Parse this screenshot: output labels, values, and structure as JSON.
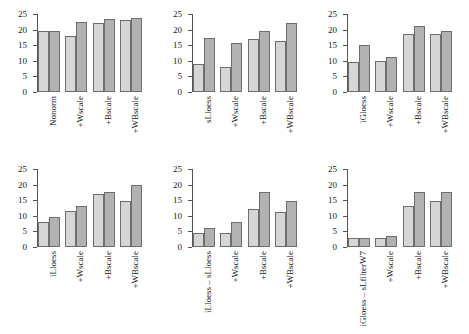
{
  "chart_data": [
    {
      "type": "bar",
      "title": "",
      "xlabel": "",
      "ylabel": "",
      "ylim": [
        0,
        25
      ],
      "yticks": [
        0,
        5,
        10,
        15,
        20,
        25
      ],
      "grid": false,
      "legend": "none",
      "categories": [
        "Nonorm",
        "+Wscale",
        "+Bscale",
        "+WBscale"
      ],
      "series": [
        {
          "name": "light",
          "values": [
            19.7,
            17.8,
            22.2,
            23.2
          ]
        },
        {
          "name": "dark",
          "values": [
            19.7,
            22.5,
            23.5,
            23.6
          ]
        }
      ]
    },
    {
      "type": "bar",
      "title": "",
      "xlabel": "",
      "ylabel": "",
      "ylim": [
        0,
        25
      ],
      "yticks": [
        0,
        5,
        10,
        15,
        20,
        25
      ],
      "grid": false,
      "legend": "none",
      "categories": [
        "sLloess",
        "+Wscale",
        "+Bscale",
        "+WBscale"
      ],
      "series": [
        {
          "name": "light",
          "values": [
            9.0,
            8.0,
            17.1,
            16.2
          ]
        },
        {
          "name": "dark",
          "values": [
            17.3,
            15.6,
            19.6,
            22.1
          ]
        }
      ]
    },
    {
      "type": "bar",
      "title": "",
      "xlabel": "",
      "ylabel": "",
      "ylim": [
        0,
        25
      ],
      "yticks": [
        0,
        5,
        10,
        15,
        20,
        25
      ],
      "grid": false,
      "legend": "none",
      "categories": [
        "iGloess",
        "+Wscale",
        "+Bscale",
        "+WBscale"
      ],
      "series": [
        {
          "name": "light",
          "values": [
            9.6,
            10.0,
            18.5,
            18.5
          ]
        },
        {
          "name": "dark",
          "values": [
            15.0,
            11.1,
            21.0,
            19.6
          ]
        }
      ]
    },
    {
      "type": "bar",
      "title": "",
      "xlabel": "",
      "ylabel": "",
      "ylim": [
        0,
        25
      ],
      "yticks": [
        0,
        5,
        10,
        15,
        20,
        25
      ],
      "grid": false,
      "legend": "none",
      "categories": [
        "iLloess",
        "+Wscale",
        "+Bscale",
        "+WBscale"
      ],
      "series": [
        {
          "name": "light",
          "values": [
            8.0,
            11.6,
            17.1,
            14.8
          ]
        },
        {
          "name": "dark",
          "values": [
            9.5,
            13.1,
            17.7,
            19.8
          ]
        }
      ]
    },
    {
      "type": "bar",
      "title": "",
      "xlabel": "",
      "ylabel": "",
      "ylim": [
        0,
        25
      ],
      "yticks": [
        0,
        5,
        10,
        15,
        20,
        25
      ],
      "grid": false,
      "legend": "none",
      "categories": [
        "iLloess – sLloess",
        "+Wscale",
        "+Bscale",
        "+WBscale"
      ],
      "series": [
        {
          "name": "light",
          "values": [
            4.4,
            4.6,
            12.2,
            11.3
          ]
        },
        {
          "name": "dark",
          "values": [
            6.1,
            8.1,
            17.7,
            14.8
          ]
        }
      ]
    },
    {
      "type": "bar",
      "title": "",
      "xlabel": "",
      "ylabel": "",
      "ylim": [
        0,
        25
      ],
      "yticks": [
        0,
        5,
        10,
        15,
        20,
        25
      ],
      "grid": false,
      "legend": "none",
      "categories": [
        "iGloess – sLfilterW7",
        "+Wscale",
        "+Bscale",
        "+WBscale"
      ],
      "series": [
        {
          "name": "light",
          "values": [
            3.0,
            2.9,
            13.1,
            14.7
          ]
        },
        {
          "name": "dark",
          "values": [
            3.0,
            3.6,
            17.6,
            17.7
          ]
        }
      ]
    }
  ],
  "style": {
    "bar_light_color": "#d6d6d6",
    "bar_dark_color": "#b2b2b2",
    "bar_border_color": "#6e6e6e",
    "axis_color": "#555555",
    "text_color": "#1a1a1a",
    "background": "#ffffff"
  }
}
